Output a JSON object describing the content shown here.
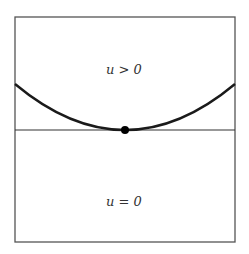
{
  "diagram": {
    "regions": {
      "upper": {
        "label": "u > 0"
      },
      "lower": {
        "label": "u = 0"
      }
    },
    "elements": {
      "box": {
        "x": 15,
        "y": 17,
        "width": 220,
        "height": 225,
        "stroke": "#555555"
      },
      "horizontal_line": {
        "y": 130,
        "stroke": "#333333"
      },
      "curve": {
        "type": "parabola",
        "start": [
          15,
          84
        ],
        "vertex": [
          125,
          130
        ],
        "end": [
          235,
          84
        ],
        "stroke": "#1a1a1a"
      },
      "contact_point": {
        "cx": 125,
        "cy": 130,
        "r": 4,
        "fill": "#000000"
      }
    }
  }
}
